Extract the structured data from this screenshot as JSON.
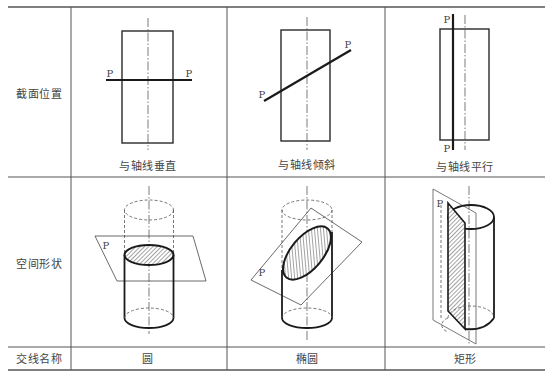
{
  "table": {
    "row_headers": [
      "截面位置",
      "空间形状",
      "交线名称"
    ],
    "columns": [
      {
        "caption": "与轴线垂直",
        "intersection_name": "圆",
        "plane_label_left": "P",
        "plane_label_right": "P",
        "space_plane_label": "P"
      },
      {
        "caption": "与轴线倾斜",
        "intersection_name": "椭圆",
        "plane_label_left": "P",
        "plane_label_right": "P",
        "space_plane_label": "P"
      },
      {
        "caption": "与轴线平行",
        "intersection_name": "矩形",
        "plane_label_top": "P",
        "plane_label_bottom": "P",
        "space_plane_label": "P"
      }
    ]
  },
  "colors": {
    "line": "#2a2a2a",
    "grid": "#555555",
    "text": "#444444",
    "hatch": "#333333"
  }
}
